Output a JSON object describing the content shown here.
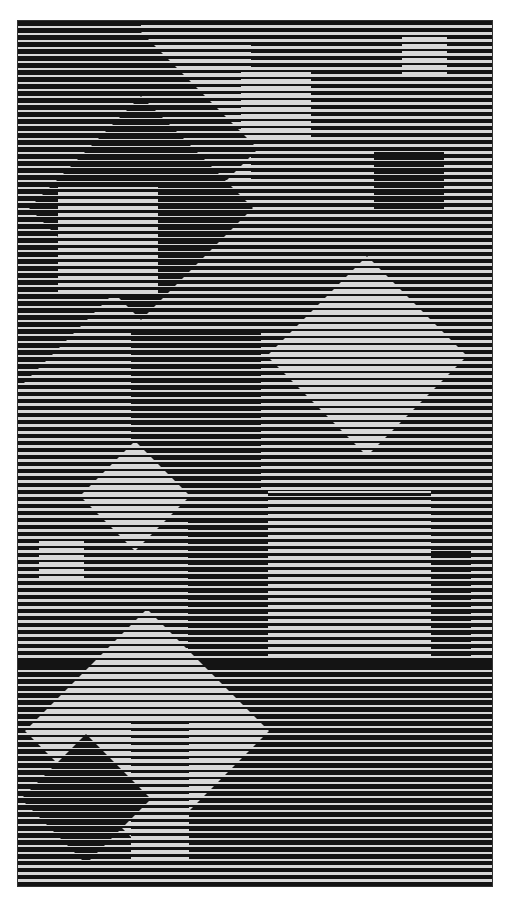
{
  "artwork": {
    "frame": {
      "x": 17,
      "y": 20,
      "w": 476,
      "h": 867
    },
    "stripe_period": 7,
    "colors": {
      "dark": "#141414",
      "light": "#d8d8d8"
    },
    "densities": {
      "base": 4,
      "light": 2,
      "midlight": 3,
      "dark": 5,
      "verydark": 6
    },
    "shapes": [
      {
        "kind": "rect",
        "x": 123,
        "y": 20,
        "w": 110,
        "h": 140,
        "density": "midlight"
      },
      {
        "kind": "rect",
        "x": 223,
        "y": 50,
        "w": 70,
        "h": 70,
        "density": "light"
      },
      {
        "kind": "rect",
        "x": 384,
        "y": 13,
        "w": 45,
        "h": 42,
        "density": "light"
      },
      {
        "kind": "rect",
        "x": 356,
        "y": 128,
        "w": 70,
        "h": 65,
        "density": "verydark"
      },
      {
        "kind": "diamond",
        "cx": 0,
        "cy": 128,
        "r": 240,
        "density": "dark"
      },
      {
        "kind": "rect",
        "x": 0,
        "y": 0,
        "w": 123,
        "h": 160,
        "density": "dark"
      },
      {
        "kind": "diamond",
        "cx": 123,
        "cy": 187,
        "r": 112,
        "density": "verydark"
      },
      {
        "kind": "rect",
        "x": 40,
        "y": 165,
        "w": 100,
        "h": 110,
        "density": "midlight"
      },
      {
        "kind": "rect",
        "x": 113,
        "y": 310,
        "w": 130,
        "h": 160,
        "density": "dark"
      },
      {
        "kind": "diamond",
        "cx": 349,
        "cy": 335,
        "r": 100,
        "density": "light"
      },
      {
        "kind": "diamond",
        "cx": 117,
        "cy": 475,
        "r": 55,
        "density": "light"
      },
      {
        "kind": "rect",
        "x": 21,
        "y": 520,
        "w": 45,
        "h": 42,
        "density": "light"
      },
      {
        "kind": "rect",
        "x": 250,
        "y": 470,
        "w": 163,
        "h": 165,
        "density": "midlight"
      },
      {
        "kind": "rect",
        "x": 413,
        "y": 530,
        "w": 40,
        "h": 130,
        "density": "dark"
      },
      {
        "kind": "rect",
        "x": 170,
        "y": 500,
        "w": 80,
        "h": 140,
        "density": "dark"
      },
      {
        "kind": "rect",
        "x": 0,
        "y": 640,
        "w": 476,
        "h": 200,
        "density": "dark"
      },
      {
        "kind": "diamond",
        "cx": 129,
        "cy": 710,
        "r": 122,
        "density": "light"
      },
      {
        "kind": "rect",
        "x": 113,
        "y": 700,
        "w": 58,
        "h": 140,
        "density": "midlight"
      },
      {
        "kind": "diamond",
        "cx": 68,
        "cy": 778,
        "r": 65,
        "density": "verydark"
      }
    ]
  }
}
